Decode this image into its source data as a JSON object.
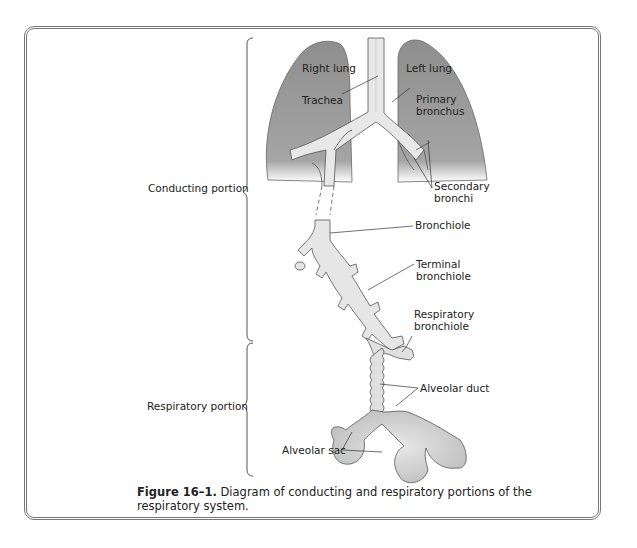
{
  "figure": {
    "caption_number": "Figure 16–1.",
    "caption_text": " Diagram of conducting and respiratory portions of the respiratory system."
  },
  "labels": {
    "right_lung": "Right lung",
    "left_lung": "Left lung",
    "trachea": "Trachea",
    "primary_bronchus_1": "Primary",
    "primary_bronchus_2": "bronchus",
    "secondary_bronchi_1": "Secondary",
    "secondary_bronchi_2": "bronchi",
    "bronchiole": "Bronchiole",
    "terminal_bronchiole_1": "Terminal",
    "terminal_bronchiole_2": "bronchiole",
    "respiratory_bronchiole_1": "Respiratory",
    "respiratory_bronchiole_2": "bronchiole",
    "alveolar_duct": "Alveolar duct",
    "alveolar_sac": "Alveolar sac",
    "conducting_portion": "Conducting portion",
    "respiratory_portion": "Respiratory portion"
  },
  "colors": {
    "lung_fill": "#9a9a9a",
    "airway_fill": "#e6e6e6",
    "alveolar_fill": "#c8c8c8",
    "line": "#444444"
  }
}
